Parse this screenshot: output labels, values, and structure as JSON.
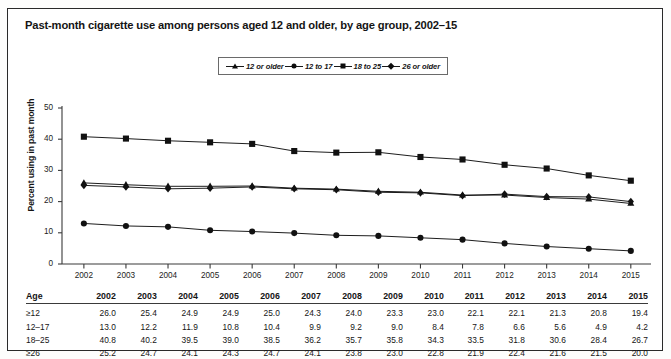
{
  "figure": {
    "title": "Past-month cigarette use among persons aged 12 and older, by age group, 2002–15"
  },
  "legend": {
    "items": [
      {
        "label": "12 or older",
        "marker": "triangle"
      },
      {
        "label": "12 to 17",
        "marker": "circle"
      },
      {
        "label": "18 to 25",
        "marker": "square"
      },
      {
        "label": "26 or older",
        "marker": "diamond"
      }
    ]
  },
  "table": {
    "row_header": "Age",
    "columns": [
      "2002",
      "2003",
      "2004",
      "2005",
      "2006",
      "2007",
      "2008",
      "2009",
      "2010",
      "2011",
      "2012",
      "2013",
      "2014",
      "2015"
    ],
    "rows": [
      {
        "label": "≥12",
        "values": [
          "26.0",
          "25.4",
          "24.9",
          "24.9",
          "25.0",
          "24.3",
          "24.0",
          "23.3",
          "23.0",
          "22.1",
          "22.1",
          "21.3",
          "20.8",
          "19.4"
        ]
      },
      {
        "label": "12–17",
        "values": [
          "13.0",
          "12.2",
          "11.9",
          "10.8",
          "10.4",
          "9.9",
          "9.2",
          "9.0",
          "8.4",
          "7.8",
          "6.6",
          "5.6",
          "4.9",
          "4.2"
        ]
      },
      {
        "label": "18–25",
        "values": [
          "40.8",
          "40.2",
          "39.5",
          "39.0",
          "38.5",
          "36.2",
          "35.7",
          "35.8",
          "34.3",
          "33.5",
          "31.8",
          "30.6",
          "28.4",
          "26.7"
        ]
      },
      {
        "label": "≥26",
        "values": [
          "25.2",
          "24.7",
          "24.1",
          "24.3",
          "24.7",
          "24.1",
          "23.8",
          "23.0",
          "22.8",
          "21.9",
          "22.4",
          "21.6",
          "21.5",
          "20.0"
        ]
      }
    ]
  },
  "chart_data": {
    "type": "line",
    "title": "Past-month cigarette use among persons aged 12 and older, by age group, 2002–15",
    "xlabel": "",
    "ylabel": "Percent using in past month",
    "x": [
      2002,
      2003,
      2004,
      2005,
      2006,
      2007,
      2008,
      2009,
      2010,
      2011,
      2012,
      2013,
      2014,
      2015
    ],
    "xtick_labels": [
      "2002",
      "2003",
      "2004",
      "2005",
      "2006",
      "2007",
      "2008",
      "2009",
      "2010",
      "2011",
      "2012",
      "2013",
      "2014",
      "2015"
    ],
    "ytick_labels": [
      "0",
      "10",
      "20",
      "30",
      "40",
      "50"
    ],
    "yticks": [
      0,
      10,
      20,
      30,
      40,
      50
    ],
    "ylim": [
      0,
      50
    ],
    "grid": false,
    "legend_position": "top-center",
    "series": [
      {
        "name": "12 or older",
        "marker": "triangle",
        "color": "#111111",
        "values": [
          26.0,
          25.4,
          24.9,
          24.9,
          25.0,
          24.3,
          24.0,
          23.3,
          23.0,
          22.1,
          22.1,
          21.3,
          20.8,
          19.4
        ]
      },
      {
        "name": "12 to 17",
        "marker": "circle",
        "color": "#111111",
        "values": [
          13.0,
          12.2,
          11.9,
          10.8,
          10.4,
          9.9,
          9.2,
          9.0,
          8.4,
          7.8,
          6.6,
          5.6,
          4.9,
          4.2
        ]
      },
      {
        "name": "18 to 25",
        "marker": "square",
        "color": "#111111",
        "values": [
          40.8,
          40.2,
          39.5,
          39.0,
          38.5,
          36.2,
          35.7,
          35.8,
          34.3,
          33.5,
          31.8,
          30.6,
          28.4,
          26.7
        ]
      },
      {
        "name": "26 or older",
        "marker": "diamond",
        "color": "#111111",
        "values": [
          25.2,
          24.7,
          24.1,
          24.3,
          24.7,
          24.1,
          23.8,
          23.0,
          22.8,
          21.9,
          22.4,
          21.6,
          21.5,
          20.0
        ]
      }
    ]
  },
  "axes": {
    "y_title": "Percent using in past month"
  }
}
